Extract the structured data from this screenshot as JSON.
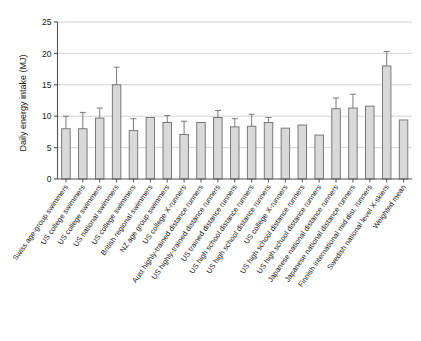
{
  "chart_data": {
    "type": "bar",
    "title": "",
    "xlabel": "",
    "ylabel": "Daily energy intake (MJ)",
    "ylim": [
      0,
      25
    ],
    "yticks": [
      0,
      5,
      10,
      15,
      20,
      25
    ],
    "ytick_labels": [
      "0",
      "5",
      "10",
      "15",
      "20",
      "25"
    ],
    "grid": true,
    "grid_axis": "y",
    "legend": "none",
    "error_bars": "upper-only",
    "bar_fill": "#d9d9d9",
    "bar_edge": "#6e6e6e",
    "grid_color": "#c9c9c9",
    "axis_color": "#555555",
    "categories": [
      "Swiss age-group swimmers",
      "US college swimmers",
      "US college swimmers",
      "US national swimmers",
      "US college swimmers",
      "British regional swimmers",
      "NZ age group swimmers",
      "US college X-runners",
      "Aust highly-trained distance runners",
      "US highly-trained distance runners",
      "US trained distance runners",
      "US high school distance runners",
      "US high school distance runners",
      "US college X-runners",
      "US high school distance runners",
      "US high school distance runners",
      "Japanese national distance runners",
      "Japanese national distance runners",
      "Finnish international mid dist. runners",
      "Swedish national level X-skiers",
      "Weighted mean"
    ],
    "values": [
      8.0,
      8.0,
      9.7,
      15.0,
      7.7,
      9.8,
      9.0,
      7.1,
      9.0,
      9.8,
      8.3,
      8.4,
      9.0,
      8.1,
      8.6,
      7.0,
      11.2,
      11.3,
      11.6,
      18.0,
      9.4
    ],
    "errors_upper": [
      10.0,
      10.6,
      11.3,
      17.8,
      9.6,
      9.8,
      10.1,
      9.2,
      9.0,
      10.9,
      9.6,
      10.3,
      9.8,
      8.1,
      8.6,
      7.0,
      12.9,
      13.5,
      11.6,
      20.3,
      9.4
    ],
    "has_error": [
      true,
      true,
      true,
      true,
      true,
      false,
      true,
      true,
      false,
      true,
      true,
      true,
      true,
      false,
      false,
      false,
      true,
      true,
      false,
      true,
      false
    ]
  }
}
